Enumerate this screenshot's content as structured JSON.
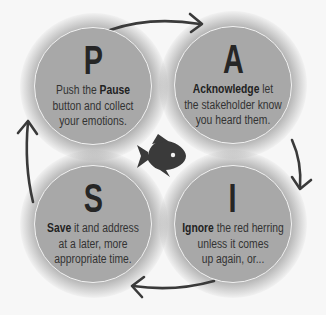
{
  "diagram": {
    "colors": {
      "background": "#f7f7f7",
      "circle_fill": "#a8a8a8",
      "circle_border": "#f2f2f2",
      "text": "#2b2b2b",
      "arrow": "#3a3a3a",
      "fish": "#3a3a3a"
    },
    "center_icon": "fish-icon",
    "steps": [
      {
        "letter": "P",
        "bold": "Pause",
        "pre": "Push the ",
        "post": "",
        "line2": "button and collect",
        "line3": "your emotions."
      },
      {
        "letter": "A",
        "bold": "Acknowledge",
        "pre": "",
        "post": " let",
        "line2": "the stakeholder know",
        "line3": "you heard them."
      },
      {
        "letter": "I",
        "bold": "Ignore",
        "pre": "",
        "post": " the red herring",
        "line2": "unless it comes",
        "line3": "up again, or..."
      },
      {
        "letter": "S",
        "bold": "Save",
        "pre": "",
        "post": " it and address",
        "line2": "at a later, more",
        "line3": "appropriate time."
      }
    ],
    "arrows": [
      "P-to-A",
      "A-to-I",
      "I-to-S",
      "S-to-P"
    ]
  }
}
